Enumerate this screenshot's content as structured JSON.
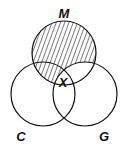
{
  "diagram": {
    "type": "venn",
    "sets": [
      {
        "id": "M",
        "label": "M",
        "cx": 64,
        "cy": 53,
        "r": 32
      },
      {
        "id": "C",
        "label": "C",
        "cx": 43,
        "cy": 94,
        "r": 32
      },
      {
        "id": "G",
        "label": "G",
        "cx": 85,
        "cy": 94,
        "r": 32
      }
    ],
    "shaded_region": "M minus G (hatched)",
    "marked_region": {
      "label": "X",
      "region": "M ∩ C ∩ G"
    },
    "colors": {
      "stroke": "#111111",
      "background": "#ffffff",
      "hatch": "#111111"
    }
  },
  "labels": {
    "m": "M",
    "c": "C",
    "g": "G",
    "x": "X"
  }
}
